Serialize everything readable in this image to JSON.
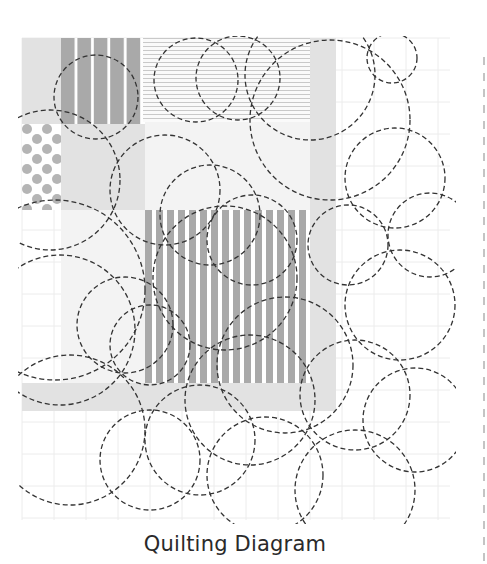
{
  "caption": "Quilting Diagram",
  "colors": {
    "background": "#ffffff",
    "grid": "#ececec",
    "light_fabric": "#e2e2e2",
    "very_light_fabric": "#f3f3f3",
    "medium_fabric": "#a9a9a9",
    "dot_fabric": "#b5b5b5",
    "hline_fabric": "#c9c9c9",
    "stitch": "#333333",
    "border_dash": "#c4c4c4"
  },
  "grid": {
    "x0": 22,
    "y0": 38,
    "x1": 450,
    "y1": 520,
    "step": 32
  },
  "right_border": {
    "x": 484,
    "y0": 57,
    "y1": 564
  },
  "blocks": [
    {
      "name": "top-left-light-block",
      "x": 22,
      "y": 38,
      "w": 39,
      "h": 86,
      "fill": "light_fabric"
    },
    {
      "name": "top-vertical-stripe-block",
      "x": 61,
      "y": 38,
      "w": 82,
      "h": 86,
      "pattern": "wide-stripes"
    },
    {
      "name": "top-horizontal-line-block",
      "x": 143,
      "y": 38,
      "w": 167,
      "h": 84,
      "pattern": "hlines"
    },
    {
      "name": "right-light-band",
      "x": 310,
      "y": 38,
      "w": 26,
      "h": 345,
      "fill": "light_fabric"
    },
    {
      "name": "dot-block",
      "x": 22,
      "y": 124,
      "w": 39,
      "h": 86,
      "pattern": "dots"
    },
    {
      "name": "middle-left-light-block",
      "x": 61,
      "y": 124,
      "w": 84,
      "h": 86,
      "fill": "light_fabric"
    },
    {
      "name": "center-very-light-block",
      "x": 145,
      "y": 122,
      "w": 165,
      "h": 88,
      "fill": "very_light_fabric"
    },
    {
      "name": "left-very-light-column",
      "x": 61,
      "y": 210,
      "w": 84,
      "h": 173,
      "fill": "very_light_fabric"
    },
    {
      "name": "center-stripe-block",
      "x": 145,
      "y": 210,
      "w": 165,
      "h": 173,
      "pattern": "narrow-stripes"
    },
    {
      "name": "bottom-light-band",
      "x": 22,
      "y": 383,
      "w": 314,
      "h": 28,
      "fill": "light_fabric"
    }
  ],
  "stitch_circles": [
    {
      "cx": 96,
      "cy": 97,
      "r": 42
    },
    {
      "cx": 196,
      "cy": 80,
      "r": 42
    },
    {
      "cx": 238,
      "cy": 78,
      "r": 42
    },
    {
      "cx": 310,
      "cy": 75,
      "r": 65
    },
    {
      "cx": 330,
      "cy": 120,
      "r": 80
    },
    {
      "cx": 395,
      "cy": 178,
      "r": 50
    },
    {
      "cx": 430,
      "cy": 235,
      "r": 42
    },
    {
      "cx": 50,
      "cy": 180,
      "r": 70
    },
    {
      "cx": 165,
      "cy": 190,
      "r": 55
    },
    {
      "cx": 210,
      "cy": 215,
      "r": 50
    },
    {
      "cx": 252,
      "cy": 240,
      "r": 45
    },
    {
      "cx": 348,
      "cy": 245,
      "r": 40
    },
    {
      "cx": 400,
      "cy": 305,
      "r": 55
    },
    {
      "cx": 60,
      "cy": 330,
      "r": 75
    },
    {
      "cx": 55,
      "cy": 290,
      "r": 90
    },
    {
      "cx": 125,
      "cy": 325,
      "r": 48
    },
    {
      "cx": 150,
      "cy": 345,
      "r": 40
    },
    {
      "cx": 225,
      "cy": 278,
      "r": 72
    },
    {
      "cx": 285,
      "cy": 365,
      "r": 68
    },
    {
      "cx": 250,
      "cy": 400,
      "r": 65
    },
    {
      "cx": 355,
      "cy": 395,
      "r": 55
    },
    {
      "cx": 415,
      "cy": 420,
      "r": 52
    },
    {
      "cx": 70,
      "cy": 430,
      "r": 75
    },
    {
      "cx": 150,
      "cy": 460,
      "r": 50
    },
    {
      "cx": 200,
      "cy": 440,
      "r": 55
    },
    {
      "cx": 265,
      "cy": 475,
      "r": 58
    },
    {
      "cx": 355,
      "cy": 490,
      "r": 60
    },
    {
      "cx": 392,
      "cy": 58,
      "r": 25
    }
  ]
}
